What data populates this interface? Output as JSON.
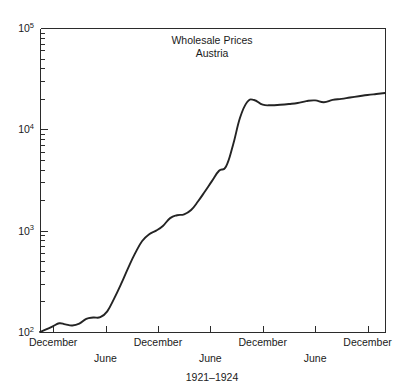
{
  "chart_data": {
    "type": "line",
    "title": "Wholesale Prices",
    "subtitle": "Austria",
    "xlabel": "1921–1924",
    "ylabel": "",
    "yscale": "log",
    "ylim": [
      100,
      100000
    ],
    "ytick_labels": [
      "10",
      "10",
      "10",
      "10"
    ],
    "ytick_exponents": [
      "5",
      "4",
      "3",
      "2"
    ],
    "ytick_values": [
      100000,
      10000,
      1000,
      100
    ],
    "xtick_row1": [
      "December",
      "December",
      "December",
      "December"
    ],
    "xtick_row2": [
      "June",
      "June",
      "June"
    ],
    "xtick_row1_months": [
      0,
      12,
      24,
      36
    ],
    "xtick_row2_months": [
      6,
      18,
      30
    ],
    "grid": false,
    "legend": null,
    "xlim_months": [
      -1.5,
      38
    ],
    "series": [
      {
        "name": "Wholesale price index, Austria",
        "x_months": [
          -1.5,
          -0.8,
          0.0,
          0.7,
          1.4,
          2.2,
          3.0,
          3.8,
          4.6,
          5.4,
          6.2,
          7.0,
          7.8,
          8.6,
          9.4,
          10.2,
          11.0,
          11.8,
          12.6,
          13.4,
          14.2,
          15.0,
          15.8,
          16.6,
          17.4,
          18.2,
          19.0,
          19.8,
          20.6,
          21.4,
          22.2,
          23.0,
          24.0,
          25.0,
          26.0,
          27.0,
          28.0,
          29.0,
          30.0,
          31.0,
          32.0,
          33.0,
          34.0,
          35.0,
          36.0,
          37.0,
          38.0
        ],
        "values": [
          100,
          106,
          114,
          122,
          119,
          116,
          121,
          135,
          139,
          140,
          160,
          215,
          300,
          430,
          600,
          790,
          920,
          1000,
          1120,
          1330,
          1420,
          1450,
          1600,
          1950,
          2450,
          3100,
          3900,
          4300,
          7000,
          13000,
          18500,
          19500,
          17500,
          17300,
          17500,
          17800,
          18200,
          19000,
          19300,
          18500,
          19500,
          20000,
          20600,
          21200,
          21800,
          22300,
          22800
        ]
      }
    ]
  },
  "plot": {
    "left_px": 40,
    "right_px": 385,
    "top_px": 28,
    "bottom_px": 332
  }
}
